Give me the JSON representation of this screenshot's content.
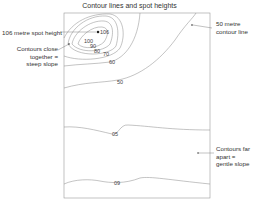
{
  "title": "Contour lines and spot heights",
  "annotations": {
    "spot_height": "106 metre spot height",
    "steep_line1": "Contours close",
    "steep_line2": "together =",
    "steep_line3": "steep slope",
    "contour50_line1": "50 metre",
    "contour50_line2": "contour line",
    "gentle_line1": "Contours far",
    "gentle_line2": "apart =",
    "gentle_line3": "gentle slope"
  },
  "contour_labels": {
    "spot": "106",
    "c100": "100",
    "c90": "90",
    "c80": "80",
    "c70": "70",
    "c60": "60",
    "c50": "50",
    "c40": "05",
    "c30": "09"
  },
  "colors": {
    "line": "#888888",
    "frame": "#999999",
    "text": "#333333"
  }
}
